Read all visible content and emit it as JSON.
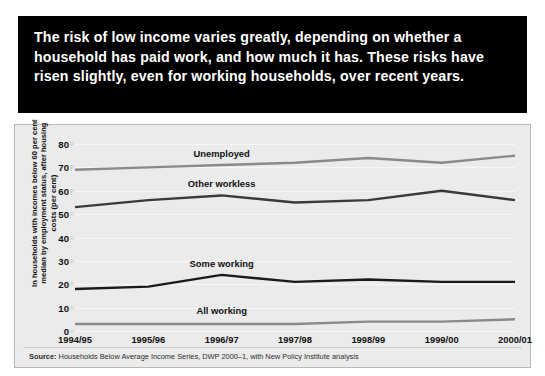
{
  "banner": {
    "text": "The risk of low income varies greatly, depending on whether a household has paid work, and how much it has. These risks have risen slightly, even for working households, over recent years."
  },
  "chart_data": {
    "type": "line",
    "title": "",
    "xlabel": "",
    "ylabel": "In households with incomes below 60 per cent median by employment status, after housing costs (per cent)",
    "categories": [
      "1994/95",
      "1995/96",
      "1996/97",
      "1997/98",
      "1998/99",
      "1999/00",
      "2000/01"
    ],
    "ylim": [
      0,
      80
    ],
    "yticks": [
      0,
      10,
      20,
      30,
      40,
      50,
      60,
      70,
      80
    ],
    "grid": true,
    "legend_position": "inline-labels",
    "series": [
      {
        "name": "Unemployed",
        "color": "#8a8a8a",
        "values": [
          69,
          70,
          71,
          72,
          74,
          72,
          75
        ],
        "label_x_index": 2,
        "label_offset_y": 6
      },
      {
        "name": "Other workless",
        "color": "#3a3a3a",
        "values": [
          53,
          56,
          58,
          55,
          56,
          60,
          56
        ],
        "label_x_index": 2,
        "label_offset_y": 6
      },
      {
        "name": "Some working",
        "color": "#1a1a1a",
        "values": [
          18,
          19,
          24,
          21,
          22,
          21,
          21
        ],
        "label_x_index": 2,
        "label_offset_y": 6
      },
      {
        "name": "All working",
        "color": "#8a8a8a",
        "values": [
          3,
          3,
          3,
          3,
          4,
          4,
          5
        ],
        "label_x_index": 2,
        "label_offset_y": 8
      }
    ]
  },
  "source": {
    "prefix": "Source:",
    "text": "Households Below Average Income Series, DWP 2000–1, with New Policy Institute analysis"
  },
  "colors": {
    "panel_background": "#ebebeb",
    "banner_background": "#000000",
    "banner_text": "#ffffff",
    "gridline": "#f7f7f7"
  }
}
